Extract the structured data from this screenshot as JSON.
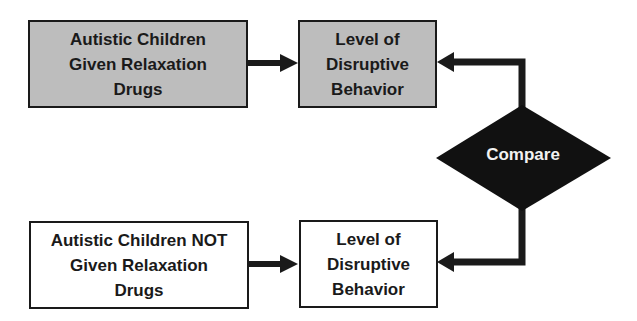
{
  "diagram": {
    "type": "flowchart",
    "colors": {
      "treatment_fill": "#bdbdbd",
      "control_fill": "#ffffff",
      "stroke": "#1a1a1a",
      "decision_fill": "#111111",
      "decision_text": "#f2f2f2"
    },
    "nodes": {
      "treatment_group": {
        "label": "Autistic Children\nGiven Relaxation\nDrugs",
        "shape": "rectangle",
        "fill": "gray"
      },
      "treatment_outcome": {
        "label": "Level of\nDisruptive\nBehavior",
        "shape": "rectangle",
        "fill": "gray"
      },
      "control_group": {
        "label": "Autistic Children NOT\nGiven Relaxation\nDrugs",
        "shape": "rectangle",
        "fill": "white"
      },
      "control_outcome": {
        "label": "Level of\nDisruptive\nBehavior",
        "shape": "rectangle",
        "fill": "white"
      },
      "compare": {
        "label": "Compare",
        "shape": "diamond",
        "fill": "black"
      }
    },
    "edges": [
      {
        "from": "treatment_group",
        "to": "treatment_outcome"
      },
      {
        "from": "control_group",
        "to": "control_outcome"
      },
      {
        "from": "compare",
        "to": "treatment_outcome"
      },
      {
        "from": "compare",
        "to": "control_outcome"
      }
    ]
  }
}
